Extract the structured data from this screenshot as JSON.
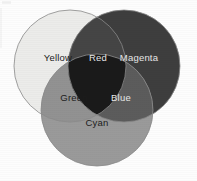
{
  "diagram": {
    "canvas": {
      "width": 197,
      "height": 181,
      "background_color": "#fdfdfd"
    },
    "circles": [
      {
        "id": "yellow",
        "label": "Yellow",
        "cx": 70,
        "cy": 66,
        "r": 56,
        "fill_color": "#ececea",
        "stroke_color": "#8a8a8a"
      },
      {
        "id": "magenta",
        "label": "Magenta",
        "cx": 124,
        "cy": 66,
        "r": 56,
        "fill_color": "#3e3e3e",
        "stroke_color": "#8a8a8a"
      },
      {
        "id": "cyan",
        "label": "Cyan",
        "cx": 97,
        "cy": 110,
        "r": 56,
        "fill_color": "#9a9a9a",
        "stroke_color": "#8a8a8a"
      }
    ],
    "intersections": [
      {
        "id": "red",
        "label": "Red",
        "of": "yellow + magenta",
        "fill_color": "#454545",
        "label_x": 98,
        "label_y": 58,
        "label_style": "light"
      },
      {
        "id": "green",
        "label": "Green",
        "of": "yellow + cyan",
        "fill_color": "#929292",
        "label_x": 74,
        "label_y": 98,
        "label_style": "dark"
      },
      {
        "id": "blue",
        "label": "Blue",
        "of": "magenta + cyan",
        "fill_color": "#5c5c5c",
        "label_x": 121,
        "label_y": 98,
        "label_style": "light"
      },
      {
        "id": "center",
        "label": "",
        "of": "yellow + magenta + cyan",
        "fill_color": "#1a1a1a",
        "label_x": 97,
        "label_y": 80,
        "label_style": "light"
      }
    ],
    "labels": [
      {
        "id": "yellow-label",
        "text": "Yellow",
        "x": 58,
        "y": 58,
        "style": "dark"
      },
      {
        "id": "red-label",
        "text": "Red",
        "x": 98,
        "y": 58,
        "style": "light"
      },
      {
        "id": "magenta-label",
        "text": "Magenta",
        "x": 139,
        "y": 58,
        "style": "light"
      },
      {
        "id": "green-label",
        "text": "Green",
        "x": 74,
        "y": 98,
        "style": "dark"
      },
      {
        "id": "blue-label",
        "text": "Blue",
        "x": 121,
        "y": 98,
        "style": "light"
      },
      {
        "id": "cyan-label",
        "text": "Cyan",
        "x": 97,
        "y": 123,
        "style": "dark"
      }
    ]
  }
}
